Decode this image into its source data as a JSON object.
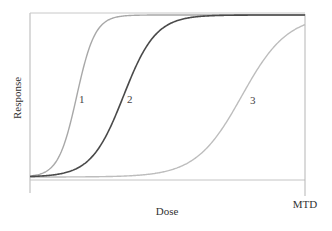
{
  "chart_data": {
    "type": "line",
    "title": "",
    "xlabel": "Dose",
    "ylabel": "Response",
    "x_tick_labels": [
      {
        "position": "end",
        "label": "MTD"
      }
    ],
    "y_tick_labels": [],
    "xlim": [
      0,
      1
    ],
    "ylim": [
      0,
      1
    ],
    "grid": false,
    "legend": "none (curves labeled inline)",
    "series": [
      {
        "name": "1",
        "label_x": 0.19,
        "midpoint": 0.17,
        "steepness": 30,
        "color": "#a8a8a8",
        "width": 1.4
      },
      {
        "name": "2",
        "label_x": 0.36,
        "midpoint": 0.34,
        "steepness": 17,
        "color": "#4a4a4a",
        "width": 1.6
      },
      {
        "name": "3",
        "label_x": 0.81,
        "midpoint": 0.77,
        "steepness": 12,
        "color": "#bdbdbd",
        "width": 1.4
      }
    ],
    "upper_plateau": {
      "y": 1.0,
      "color": "#9a9a9a"
    }
  },
  "labels": {
    "xlabel": "Dose",
    "ylabel": "Response",
    "mtd": "MTD",
    "curve1": "1",
    "curve2": "2",
    "curve3": "3"
  },
  "colors": {
    "axis": "#b5b5b5",
    "text": "#333333"
  }
}
